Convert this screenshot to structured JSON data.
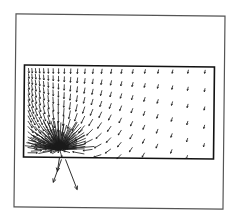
{
  "figure": {
    "type": "vector-field",
    "colors": {
      "background": "#ffffff",
      "stroke": "#1a1a1a",
      "frame": "#444444"
    },
    "outer_frame": {
      "x1": 15,
      "y1": 15,
      "x2": 224,
      "y2": 208
    },
    "domain_rect": {
      "x1": 24,
      "y1": 66,
      "x2": 214,
      "y2": 158
    },
    "focus_point": {
      "x": 60,
      "y": 150
    },
    "exit_arrows": [
      {
        "x1": 62,
        "y1": 160,
        "x2": 54,
        "y2": 183
      },
      {
        "x1": 66,
        "y1": 160,
        "x2": 78,
        "y2": 190
      },
      {
        "x1": 60,
        "y1": 158,
        "x2": 58,
        "y2": 172
      }
    ]
  }
}
